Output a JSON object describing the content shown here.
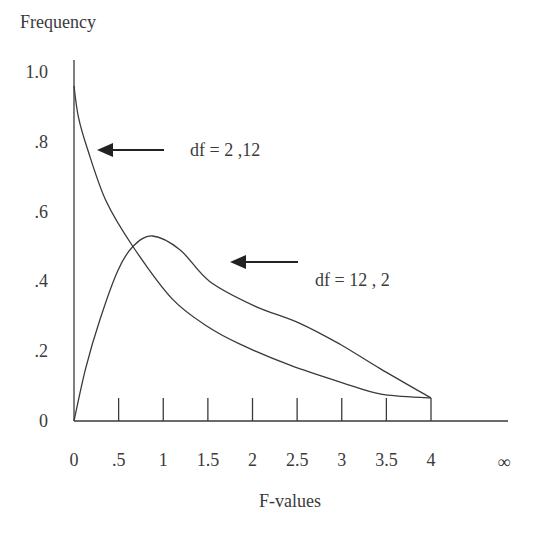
{
  "chart_data": {
    "type": "line",
    "title": "",
    "ylabel": "Frequency",
    "xlabel": "F-values",
    "xlim": [
      0,
      4
    ],
    "ylim": [
      0,
      1.0
    ],
    "grid": false,
    "x_ticks": [
      {
        "value": 0,
        "label": "0"
      },
      {
        "value": 0.5,
        "label": ".5"
      },
      {
        "value": 1,
        "label": "1"
      },
      {
        "value": 1.5,
        "label": "1.5"
      },
      {
        "value": 2,
        "label": "2"
      },
      {
        "value": 2.5,
        "label": "2.5"
      },
      {
        "value": 3,
        "label": "3"
      },
      {
        "value": 3.5,
        "label": "3.5"
      },
      {
        "value": 4,
        "label": "4"
      }
    ],
    "x_infinity_label": "∞",
    "y_ticks": [
      {
        "value": 0,
        "label": "0"
      },
      {
        "value": 0.2,
        "label": ".2"
      },
      {
        "value": 0.4,
        "label": ".4"
      },
      {
        "value": 0.6,
        "label": ".6"
      },
      {
        "value": 0.8,
        "label": ".8"
      },
      {
        "value": 1.0,
        "label": "1.0"
      }
    ],
    "series": [
      {
        "name": "df = 2 ,12",
        "x": [
          0,
          0.05,
          0.15,
          0.36,
          0.66,
          1.1,
          1.5,
          1.86,
          2.42,
          3.0,
          3.44,
          4.0
        ],
        "y": [
          0.96,
          0.87,
          0.78,
          0.63,
          0.5,
          0.35,
          0.27,
          0.22,
          0.16,
          0.11,
          0.077,
          0.066
        ]
      },
      {
        "name": "df = 12 , 2",
        "x": [
          0,
          0.13,
          0.29,
          0.49,
          0.66,
          0.88,
          1.19,
          1.52,
          2.02,
          2.53,
          2.98,
          3.43,
          4.0
        ],
        "y": [
          0,
          0.15,
          0.29,
          0.43,
          0.5,
          0.53,
          0.49,
          0.4,
          0.33,
          0.28,
          0.22,
          0.15,
          0.066
        ]
      }
    ],
    "annotations": [
      {
        "text": "df = 2 ,12",
        "arrow_to_series": "df = 2 ,12"
      },
      {
        "text": "df = 12 , 2",
        "arrow_to_series": "df = 12 , 2"
      }
    ]
  },
  "labels": {
    "y_axis_title": "Frequency",
    "x_axis_title": "F-values",
    "annotation_1": "df = 2 ,12",
    "annotation_2": "df = 12 , 2",
    "infinity": "∞"
  },
  "style": {
    "line_color": "#3a3a3a",
    "text_color": "#3a3a3a",
    "background": "#ffffff"
  }
}
